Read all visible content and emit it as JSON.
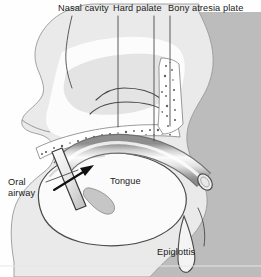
{
  "figure": {
    "width": 261,
    "height": 277,
    "background_color": "#fefefe"
  },
  "palette": {
    "line": "#3a3a3a",
    "soft_tissue_fill": "#b9b9b9",
    "skin_fill": "#efefef",
    "cavity_fill": "#fdfdfd",
    "tongue_fill": "#fbfbfb",
    "bone_speckle": "#ffffff",
    "airway_tube_light": "#f2f2f2",
    "airway_tube_mid": "#c9c9c9",
    "airway_tube_dark": "#8e8e8e",
    "label_text": "#1a1a1a",
    "leader_line": "#4a4a4a",
    "footer_rule": "#e3e3e3"
  },
  "labels": [
    {
      "id": "nasal-cavity",
      "text": "Nasal cavity",
      "x": 58,
      "y": 3
    },
    {
      "id": "hard-palate",
      "text": "Hard palate",
      "x": 113,
      "y": 3
    },
    {
      "id": "bony-atresia-plate",
      "text": "Bony atresia plate",
      "x": 168,
      "y": 3
    },
    {
      "id": "oral-airway-line1",
      "text": "Oral",
      "x": 8,
      "y": 177
    },
    {
      "id": "oral-airway-line2",
      "text": "airway",
      "x": 8,
      "y": 188
    },
    {
      "id": "tongue",
      "text": "Tongue",
      "x": 110,
      "y": 176
    },
    {
      "id": "epiglottis",
      "text": "Epiglottis",
      "x": 157,
      "y": 247
    }
  ],
  "leaders": [
    {
      "id": "leader-nasal-cavity",
      "points": "72,16 68,36 65,58 68,74 71,86"
    },
    {
      "id": "leader-hard-palate",
      "points": "118,16 118,126"
    },
    {
      "id": "leader-bony-atresia-left",
      "points": "154,16 154,140"
    },
    {
      "id": "leader-bony-atresia-right",
      "points": "170,16 170,125"
    },
    {
      "id": "leader-oral-airway",
      "points": "46,182 78,170"
    },
    {
      "id": "leader-epiglottis",
      "points": "204,246 206,232 203,218 199,208"
    }
  ],
  "annotations": {
    "insertion_arrow": {
      "id": "insertion-arrow",
      "from": {
        "x": 54,
        "y": 190
      },
      "to": {
        "x": 92,
        "y": 167
      },
      "meaning": "direction of oral airway insertion"
    }
  },
  "structures": [
    {
      "id": "head-profile",
      "name": "facial-profile-outline"
    },
    {
      "id": "pharyngeal-wall",
      "name": "posterior-pharyngeal-wall"
    },
    {
      "id": "nasal-cavity-space",
      "name": "nasal-cavity"
    },
    {
      "id": "turbinates",
      "name": "nasal-turbinates"
    },
    {
      "id": "hard-palate-bone",
      "name": "hard-palate-bone-speckled"
    },
    {
      "id": "atresia-plate",
      "name": "bony-atresia-plate-speckled"
    },
    {
      "id": "tongue-body",
      "name": "tongue"
    },
    {
      "id": "epiglottis-shape",
      "name": "epiglottis"
    },
    {
      "id": "oral-airway-tube",
      "name": "oral-airway-tube"
    },
    {
      "id": "airway-flange",
      "name": "oral-airway-flange"
    }
  ]
}
